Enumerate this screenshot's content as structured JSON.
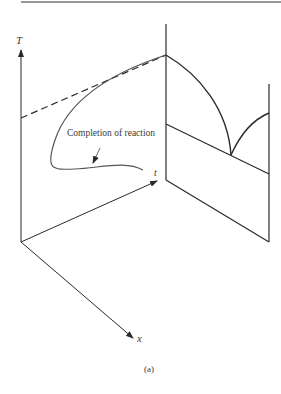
{
  "figure": {
    "caption": "(a)",
    "axes": {
      "T_label": "T",
      "t_label": "t",
      "x_label": "x"
    },
    "annotation": "Completion of reaction",
    "colors": {
      "line": "#2a2a2a",
      "curve": "#555555",
      "rule": "#333333",
      "background": "#ffffff"
    }
  }
}
